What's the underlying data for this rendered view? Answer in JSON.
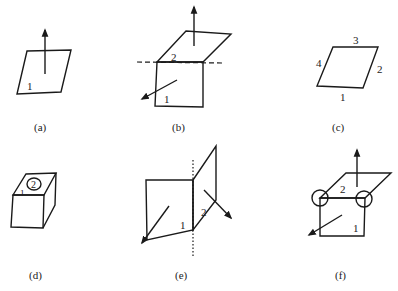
{
  "panels": [
    {
      "id": "a",
      "caption": "(a)",
      "labels": {
        "face1": "1"
      }
    },
    {
      "id": "b",
      "caption": "(b)",
      "labels": {
        "face1": "1",
        "face2": "2"
      }
    },
    {
      "id": "c",
      "caption": "(c)",
      "labels": {
        "edge1": "1",
        "edge2": "2",
        "edge3": "3",
        "edge4": "4"
      }
    },
    {
      "id": "d",
      "caption": "(d)",
      "labels": {
        "face1": "1",
        "face2": "2"
      }
    },
    {
      "id": "e",
      "caption": "(e)",
      "labels": {
        "face1": "1",
        "face2": "2"
      }
    },
    {
      "id": "f",
      "caption": "(f)",
      "labels": {
        "face1": "1",
        "face2": "2"
      }
    }
  ]
}
